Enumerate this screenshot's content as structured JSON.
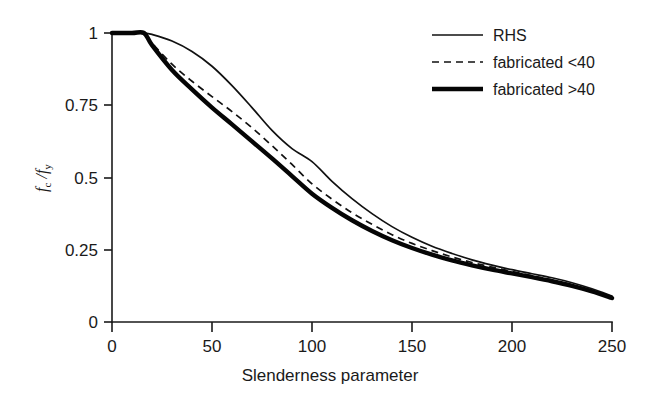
{
  "chart_data": {
    "type": "line",
    "title": "",
    "xlabel": "Slenderness parameter",
    "ylabel": "fc /fy",
    "ylabel_parts": {
      "num_main": "f",
      "num_sub": "c",
      "sep": " /",
      "den_main": "f",
      "den_sub": "y"
    },
    "xlim": [
      0,
      250
    ],
    "ylim": [
      0,
      1
    ],
    "xticks": [
      0,
      50,
      100,
      150,
      200,
      250
    ],
    "xtick_labels": [
      "0",
      "50",
      "100",
      "150",
      "200",
      "250"
    ],
    "yticks": [
      0,
      0.25,
      0.5,
      0.75,
      1
    ],
    "ytick_labels": [
      "0",
      "0.25",
      "0.5",
      "0.75",
      "1"
    ],
    "grid": false,
    "legend_position": "top-right",
    "x": [
      0,
      10,
      16,
      20,
      30,
      40,
      50,
      60,
      70,
      80,
      90,
      100,
      110,
      120,
      130,
      140,
      150,
      160,
      170,
      180,
      190,
      200,
      210,
      220,
      230,
      240,
      250
    ],
    "series": [
      {
        "name": "RHS",
        "style": "thin-solid",
        "color": "#111111",
        "values": [
          1.0,
          1.0,
          1.0,
          0.995,
          0.972,
          0.936,
          0.885,
          0.818,
          0.742,
          0.663,
          0.6,
          0.555,
          0.487,
          0.427,
          0.375,
          0.33,
          0.293,
          0.262,
          0.237,
          0.215,
          0.197,
          0.181,
          0.167,
          0.153,
          0.136,
          0.115,
          0.09
        ]
      },
      {
        "name": "fabricated <40",
        "style": "dashed",
        "color": "#111111",
        "values": [
          1.0,
          1.0,
          1.0,
          0.965,
          0.892,
          0.833,
          0.78,
          0.728,
          0.672,
          0.61,
          0.545,
          0.478,
          0.425,
          0.378,
          0.338,
          0.302,
          0.272,
          0.247,
          0.225,
          0.206,
          0.19,
          0.175,
          0.16,
          0.145,
          0.128,
          0.108,
          0.085
        ]
      },
      {
        "name": "fabricated >40",
        "style": "thick-solid",
        "color": "#050505",
        "values": [
          1.0,
          1.0,
          1.0,
          0.958,
          0.872,
          0.805,
          0.742,
          0.684,
          0.625,
          0.566,
          0.505,
          0.444,
          0.395,
          0.352,
          0.315,
          0.283,
          0.256,
          0.233,
          0.213,
          0.196,
          0.181,
          0.168,
          0.155,
          0.141,
          0.125,
          0.106,
          0.083
        ]
      }
    ]
  },
  "legend": {
    "items": [
      {
        "label": "RHS",
        "style": "thin-solid"
      },
      {
        "label": "fabricated <40",
        "style": "dashed"
      },
      {
        "label": "fabricated >40",
        "style": "thick-solid"
      }
    ]
  },
  "axes": {
    "x_title": "Slenderness parameter",
    "x_ticks": [
      "0",
      "50",
      "100",
      "150",
      "200",
      "250"
    ],
    "y_ticks": [
      "0",
      "0.25",
      "0.5",
      "0.75",
      "1"
    ]
  },
  "colors": {
    "ink": "#1a1a1a",
    "curve": "#111111",
    "curve_thick": "#050505",
    "background": "#ffffff"
  }
}
